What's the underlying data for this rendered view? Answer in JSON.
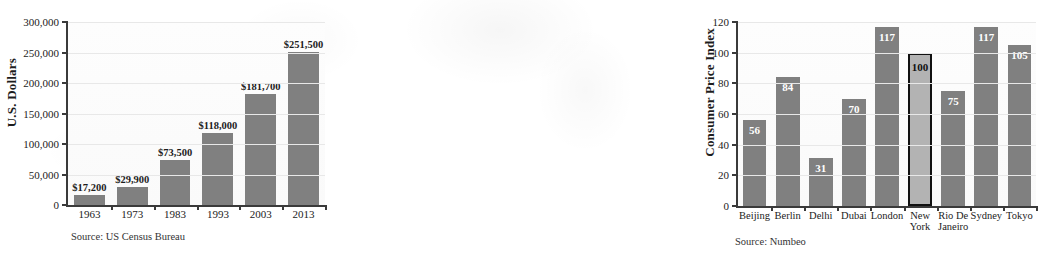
{
  "charts": [
    {
      "id": "median-home-price",
      "ylabel": "U.S. Dollars",
      "source": "Source: US Census Bureau",
      "yticks": [
        "0",
        "50,000",
        "100,000",
        "150,000",
        "200,000",
        "250,000",
        "300,000"
      ],
      "bar_color": "#808080",
      "chart_data": {
        "type": "bar",
        "title": "",
        "xlabel": "",
        "ylabel": "U.S. Dollars",
        "categories": [
          "1963",
          "1973",
          "1983",
          "1993",
          "2003",
          "2013"
        ],
        "values": [
          17200,
          29900,
          73500,
          118000,
          181700,
          251500
        ],
        "value_labels": [
          "$17,200",
          "$29,900",
          "$73,500",
          "$118,000",
          "$181,700",
          "$251,500"
        ],
        "ylim": [
          0,
          300000
        ],
        "ytick_values": [
          0,
          50000,
          100000,
          150000,
          200000,
          250000,
          300000
        ],
        "ytick_labels": [
          "0",
          "50,000",
          "100,000",
          "150,000",
          "200,000",
          "250,000",
          "300,000"
        ],
        "grid": true,
        "legend": "none",
        "label_position": "above-bar"
      }
    },
    {
      "id": "consumer-price-index",
      "ylabel": "Consumer Price Index",
      "source": "Source: Numbeo",
      "yticks": [
        "0",
        "20",
        "40",
        "60",
        "80",
        "100",
        "120"
      ],
      "bar_color": "#808080",
      "highlight_color": "#b3b3b3",
      "chart_data": {
        "type": "bar",
        "title": "",
        "xlabel": "",
        "ylabel": "Consumer Price Index",
        "categories": [
          "Beijing",
          "Berlin",
          "Delhi",
          "Dubai",
          "London",
          "New York",
          "Rio De Janeiro",
          "Sydney",
          "Tokyo"
        ],
        "values": [
          56,
          84,
          31,
          70,
          117,
          100,
          75,
          117,
          105
        ],
        "value_labels": [
          "56",
          "84",
          "31",
          "70",
          "117",
          "100",
          "75",
          "117",
          "105"
        ],
        "highlighted": [
          "New York"
        ],
        "ylim": [
          0,
          120
        ],
        "ytick_values": [
          0,
          20,
          40,
          60,
          80,
          100,
          120
        ],
        "ytick_labels": [
          "0",
          "20",
          "40",
          "60",
          "80",
          "100",
          "120"
        ],
        "grid": true,
        "legend": "none",
        "label_position": "inside-bar-top"
      }
    }
  ]
}
